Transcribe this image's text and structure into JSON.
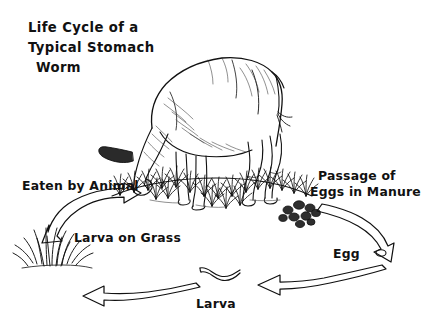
{
  "figure": {
    "kind": "life-cycle-diagram",
    "background_color": "#ffffff",
    "ink_color": "#111111",
    "width": 432,
    "height": 323
  },
  "title": {
    "line1": "Life Cycle of a",
    "line2": "Typical Stomach",
    "line3": "Worm"
  },
  "stages": {
    "eaten_by_animal": "Eaten by Animal",
    "larva_on_grass": "Larva on Grass",
    "larva": "Larva",
    "egg": "Egg",
    "passage_line1": "Passage of",
    "passage_line2": "Eggs in Manure"
  },
  "illustrations": {
    "animal": "grazing-cow",
    "ground": "grassy-mound",
    "manure": "manure-pellets",
    "egg_shape": "egg-oval",
    "larva_shape": "larva-squiggle",
    "grass_tuft": "grass-tuft"
  },
  "arrows": {
    "left_up": "double-headed-curved-arrow",
    "right_down": "curved-arrow-down",
    "bottom_left": "curved-arrow-left",
    "bottom_right": "curved-arrow-left"
  }
}
